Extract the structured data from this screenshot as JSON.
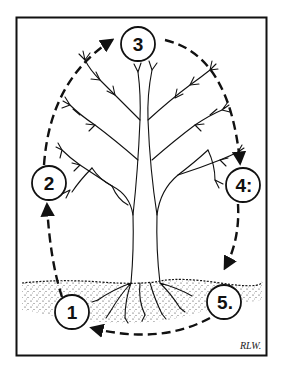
{
  "diagram": {
    "type": "cycle-illustration",
    "colors": {
      "ink": "#111111",
      "paper": "#ffffff"
    },
    "steps": [
      {
        "id": 1,
        "label": "1",
        "position": "bottom-left, in soil"
      },
      {
        "id": 2,
        "label": "2",
        "position": "left, mid trunk"
      },
      {
        "id": 3,
        "label": "3",
        "position": "top, above crown"
      },
      {
        "id": 4,
        "label": "4:",
        "position": "right, mid crown"
      },
      {
        "id": 5,
        "label": "5.",
        "position": "bottom-right, in soil"
      }
    ],
    "arrows": [
      {
        "from": "1",
        "to": "2",
        "style": "dashed"
      },
      {
        "from": "2",
        "to": "3",
        "style": "dashed"
      },
      {
        "from": "3",
        "to": "4:",
        "style": "dashed"
      },
      {
        "from": "4:",
        "to": "5.",
        "style": "dashed"
      },
      {
        "from": "5.",
        "to": "1",
        "style": "dashed"
      }
    ],
    "signature": "RLW."
  }
}
